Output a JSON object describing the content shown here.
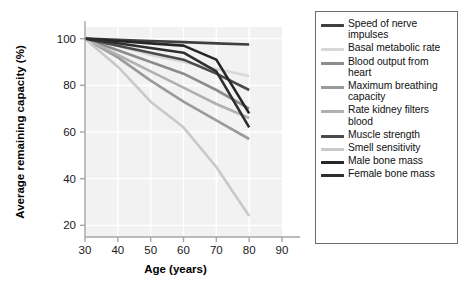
{
  "figure": {
    "background_color": "#ffffff",
    "plot_background_color": "#f2f2f2",
    "grid_color": "#ffffff",
    "axis_color": "#a6a6a6"
  },
  "legend": {
    "border_color": "#6d6d6d",
    "position": "right",
    "entries": [
      {
        "label": "Speed of nerve\nimpulses",
        "color": "#3f3f3f"
      },
      {
        "label": "Basal metabolic rate",
        "color": "#d8d8d8"
      },
      {
        "label": "Blood output from\nheart",
        "color": "#8c8c8c"
      },
      {
        "label": "Maximum breathing\ncapacity",
        "color": "#9a9a9a"
      },
      {
        "label": "Rate kidney filters\nblood",
        "color": "#b0b0b0"
      },
      {
        "label": "Muscle strength",
        "color": "#4a4a4a"
      },
      {
        "label": "Smell sensitivity",
        "color": "#c9c9c9"
      },
      {
        "label": "Male bone mass",
        "color": "#262626"
      },
      {
        "label": "Female bone mass",
        "color": "#2e2e2e"
      }
    ]
  },
  "chart_data": {
    "type": "line",
    "title": "",
    "xlabel": "Age (years)",
    "ylabel": "Average remaining capacity (%)",
    "xlim": [
      30,
      90
    ],
    "ylim": [
      15,
      105
    ],
    "xticks": [
      30,
      40,
      50,
      60,
      70,
      80,
      90
    ],
    "yticks": [
      20,
      40,
      60,
      80,
      100
    ],
    "xtick_labels": [
      "30",
      "40",
      "50",
      "60",
      "70",
      "80",
      "90"
    ],
    "ytick_labels": [
      "20",
      "40",
      "60",
      "80",
      "100"
    ],
    "grid": true,
    "legend_position": "right outside",
    "x": [
      30,
      40,
      50,
      60,
      70,
      80
    ],
    "series": [
      {
        "name": "Speed of nerve impulses",
        "color": "#3f3f3f",
        "values": [
          100,
          99.5,
          99,
          98.5,
          98,
          97.5
        ]
      },
      {
        "name": "Basal metabolic rate",
        "color": "#d8d8d8",
        "values": [
          100,
          97,
          93,
          90,
          87,
          84
        ]
      },
      {
        "name": "Blood output from heart",
        "color": "#8c8c8c",
        "values": [
          100,
          95,
          90,
          85,
          78,
          70
        ]
      },
      {
        "name": "Maximum breathing capacity",
        "color": "#9a9a9a",
        "values": [
          100,
          92,
          82,
          73,
          65,
          57
        ]
      },
      {
        "name": "Rate kidney filters blood",
        "color": "#b0b0b0",
        "values": [
          100,
          93,
          86,
          79,
          72,
          66
        ]
      },
      {
        "name": "Muscle strength",
        "color": "#4a4a4a",
        "values": [
          100,
          97,
          94,
          91,
          85,
          78
        ]
      },
      {
        "name": "Smell sensitivity",
        "color": "#c9c9c9",
        "values": [
          100,
          88,
          73,
          62,
          45,
          24
        ]
      },
      {
        "name": "Male bone mass",
        "color": "#262626",
        "values": [
          100,
          99,
          98,
          97,
          91,
          68
        ]
      },
      {
        "name": "Female bone mass",
        "color": "#2e2e2e",
        "values": [
          100,
          98,
          96,
          94,
          86,
          62
        ]
      }
    ]
  }
}
